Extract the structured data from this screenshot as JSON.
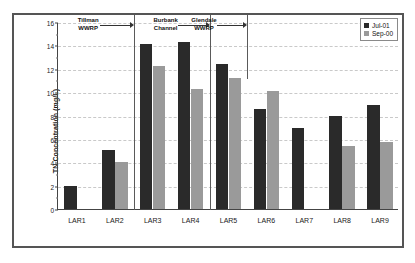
{
  "chart_data": {
    "type": "bar",
    "title": "",
    "xlabel": "",
    "ylabel": "TN Concentration (mg/L)",
    "ylim": [
      0,
      16
    ],
    "ytick_step": 2,
    "yticks": [
      "0",
      "2",
      "4",
      "6",
      "8",
      "10",
      "12",
      "14",
      "16"
    ],
    "grid": true,
    "legend_position": "top-right",
    "categories": [
      "LAR1",
      "LAR2",
      "LAR3",
      "LAR4",
      "LAR5",
      "LAR6",
      "LAR7",
      "LAR8",
      "LAR9"
    ],
    "series": [
      {
        "name": "Jul-01",
        "color": "#2a2a2a",
        "values": [
          2.0,
          5.05,
          14.1,
          14.25,
          12.4,
          8.6,
          6.9,
          7.95,
          8.9
        ]
      },
      {
        "name": "Sep-00",
        "color": "#9a9a9a",
        "values": [
          null,
          4.0,
          12.2,
          10.25,
          11.2,
          10.1,
          null,
          5.35,
          5.7
        ]
      }
    ],
    "annotations": [
      {
        "label_line1": "Tillman",
        "label_line2": "WWRP",
        "from_category": "LAR1",
        "to_category": "LAR2"
      },
      {
        "label_line1": "Burbank",
        "label_line2": "Channel",
        "from_category": "LAR3",
        "to_category": "LAR4"
      },
      {
        "label_line1": "Glendale",
        "label_line2": "WWRP",
        "from_category": "LAR4",
        "to_category": "LAR5"
      }
    ],
    "dividers_after": [
      "LAR2",
      "LAR4",
      "LAR5"
    ]
  },
  "colors": {
    "series_jul01": "#2a2a2a",
    "series_sep00": "#9a9a9a",
    "gridline": "#c9c9c9",
    "axis": "#444444",
    "frame": "#555555"
  }
}
